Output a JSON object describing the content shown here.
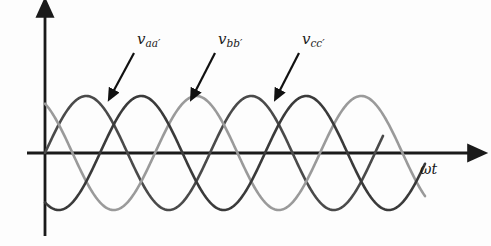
{
  "figure": {
    "background_color": "#fdfdfd"
  },
  "axes": {
    "x_axis": {
      "label": "ωt",
      "origin_x": 45,
      "origin_y": 153,
      "end_x": 470,
      "color": "#1a1a1a"
    },
    "y_axis": {
      "label": "",
      "top_y": 15,
      "bottom_y": 236,
      "x": 45,
      "color": "#1a1a1a"
    }
  },
  "annotations": [
    {
      "name": "label-vaa",
      "text_main": "v",
      "text_sub": "aa′",
      "label_x": 137,
      "label_y": 30,
      "arrow_from_x": 134,
      "arrow_from_y": 53,
      "arrow_to_x": 113,
      "arrow_to_y": 92
    },
    {
      "name": "label-vbb",
      "text_main": "v",
      "text_sub": "bb′",
      "label_x": 218,
      "label_y": 30,
      "arrow_from_x": 215,
      "arrow_from_y": 53,
      "arrow_to_x": 195,
      "arrow_to_y": 92
    },
    {
      "name": "label-vcc",
      "text_main": "v",
      "text_sub": "cc′",
      "label_x": 302,
      "label_y": 30,
      "arrow_from_x": 299,
      "arrow_from_y": 53,
      "arrow_to_x": 279,
      "arrow_to_y": 92
    }
  ],
  "chart_data": {
    "type": "line",
    "title": "",
    "xlabel": "ωt",
    "ylabel": "",
    "grid": false,
    "legend_position": "inline-annotations",
    "x_origin_px": 45,
    "y_origin_px": 153,
    "amplitude_px": 57,
    "period_px": 165,
    "x_units": "radians",
    "x_range_rad": [
      0,
      16.2
    ],
    "y_range": [
      -1,
      1
    ],
    "series": [
      {
        "name": "v_aa'",
        "label": "vaa′",
        "color": "#4a4a4a",
        "phase_deg": 0,
        "amplitude": 1,
        "start_x_px": 45,
        "end_x_px": 383,
        "peaks_px": [
          113,
          278
        ],
        "troughs_px": [
          196,
          361
        ],
        "stroke_width": 2.6
      },
      {
        "name": "v_bb'",
        "label": "vbb′",
        "color": "#9a9a9a",
        "phase_deg": 120,
        "amplitude": 1,
        "start_x_px": 45,
        "end_x_px": 425,
        "peaks_px": [
          58,
          223
        ],
        "troughs_px": [
          141,
          306
        ],
        "stroke_width": 2.6
      },
      {
        "name": "v_cc'",
        "label": "vcc′",
        "color": "#3a3a3a",
        "phase_deg": 240,
        "amplitude": 1,
        "start_x_px": 45,
        "end_x_px": 425,
        "peaks_px": [
          168,
          333
        ],
        "troughs_px": [
          86,
          251
        ],
        "stroke_width": 2.6
      }
    ]
  }
}
